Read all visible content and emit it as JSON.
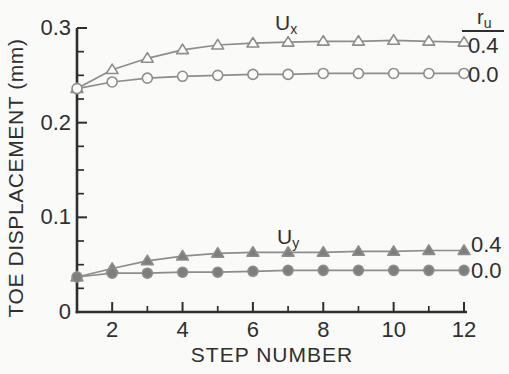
{
  "figure": {
    "width": 509,
    "height": 374,
    "background": "#fafaf8",
    "axis_color": "#2e2e2e",
    "text_color": "#2f2f2f",
    "curve_color": "#8d8d8d",
    "marker_open_fill": "#fbfbf9",
    "marker_solid_fill": "#7e7e7e"
  },
  "chart_data": {
    "type": "line",
    "title": "",
    "xlabel": "STEP NUMBER",
    "ylabel": "TOE DISPLACEMENT (mm)",
    "xlim": [
      1,
      12.1
    ],
    "ylim": [
      0,
      0.3
    ],
    "grid": false,
    "legend_position": "right-margin",
    "legend_header": {
      "base": "r",
      "sub": "u"
    },
    "x": [
      1,
      2,
      3,
      4,
      5,
      6,
      7,
      8,
      9,
      10,
      11,
      12
    ],
    "x_major_ticks": {
      "values": [
        2,
        4,
        6,
        8,
        10,
        12
      ],
      "labels": [
        "2",
        "4",
        "6",
        "8",
        "10",
        "12"
      ]
    },
    "x_minor_ticks": [
      3,
      5,
      7,
      9,
      11
    ],
    "y_major_ticks": {
      "values": [
        0,
        0.1,
        0.2,
        0.3
      ],
      "labels": [
        "0",
        "0.1",
        "0.2",
        "0.3"
      ]
    },
    "y_minor_ticks": [
      0.025,
      0.05,
      0.075,
      0.125,
      0.15,
      0.175,
      0.225,
      0.25,
      0.275
    ],
    "series": [
      {
        "name": "Ux, ru = 0.4",
        "marker": "triangle-open",
        "values": [
          0.236,
          0.256,
          0.268,
          0.277,
          0.282,
          0.284,
          0.285,
          0.286,
          0.286,
          0.287,
          0.286,
          0.285
        ],
        "right_label": {
          "text": "0.4",
          "x": 468,
          "y": 53
        }
      },
      {
        "name": "Ux, ru = 0.0",
        "marker": "circle-open",
        "values": [
          0.236,
          0.243,
          0.247,
          0.249,
          0.25,
          0.251,
          0.251,
          0.252,
          0.252,
          0.252,
          0.252,
          0.252
        ],
        "right_label": {
          "text": "0.0",
          "x": 468,
          "y": 82
        }
      },
      {
        "name": "Uy, ru = 0.4",
        "marker": "triangle-solid",
        "values": [
          0.037,
          0.046,
          0.054,
          0.059,
          0.062,
          0.063,
          0.063,
          0.063,
          0.064,
          0.064,
          0.065,
          0.065
        ],
        "right_label": {
          "text": "0.4",
          "x": 471,
          "y": 252
        }
      },
      {
        "name": "Uy, ru = 0.0",
        "marker": "circle-solid",
        "values": [
          0.037,
          0.041,
          0.041,
          0.042,
          0.042,
          0.043,
          0.044,
          0.044,
          0.044,
          0.044,
          0.044,
          0.044
        ],
        "right_label": {
          "text": "0.0",
          "x": 471,
          "y": 278
        }
      }
    ],
    "annotations": [
      {
        "id": "ux-curve-label",
        "base": "U",
        "sub": "x",
        "x": 275,
        "y": 30
      },
      {
        "id": "uy-curve-label",
        "base": "U",
        "sub": "y",
        "x": 277,
        "y": 244
      },
      {
        "id": "ru-legend-header",
        "base": "r",
        "sub": "u",
        "x": 477,
        "y": 24,
        "underline": [
          462,
          31,
          504,
          31
        ]
      }
    ]
  }
}
